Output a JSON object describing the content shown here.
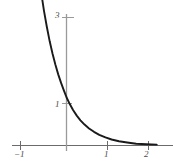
{
  "chart_data": {
    "type": "line",
    "title": "",
    "subtitle": "",
    "xlabel": "",
    "ylabel": "",
    "xlim": [
      -1,
      2.25
    ],
    "ylim": [
      -0.22,
      3.45
    ],
    "grid": false,
    "legend": null,
    "annotations": [],
    "x_ticks": [
      {
        "value": -1,
        "label": "−1"
      },
      {
        "value": 0,
        "label": ""
      },
      {
        "value": 1,
        "label": "1"
      },
      {
        "value": 2,
        "label": "2"
      }
    ],
    "y_ticks": [
      {
        "value": 1,
        "label": "1"
      },
      {
        "value": 3,
        "label": "3"
      }
    ],
    "series": [
      {
        "name": "exponential-decay",
        "color": "#1a1a1a",
        "x": [
          -0.62,
          -0.55,
          -0.48,
          -0.41,
          -0.34,
          -0.27,
          -0.2,
          -0.13,
          -0.06,
          0.0,
          0.08,
          0.16,
          0.25,
          0.34,
          0.44,
          0.55,
          0.67,
          0.8,
          0.95,
          1.1,
          1.28,
          1.48,
          1.7,
          1.95,
          2.2
        ],
        "y": [
          3.6,
          3.16,
          2.78,
          2.44,
          2.15,
          1.89,
          1.66,
          1.46,
          1.28,
          1.13,
          0.97,
          0.83,
          0.7,
          0.59,
          0.49,
          0.4,
          0.32,
          0.25,
          0.19,
          0.14,
          0.1,
          0.07,
          0.04,
          0.03,
          0.02
        ]
      }
    ]
  },
  "axes": {
    "x_axis_color": "#6b6b6b",
    "y_axis_color": "#9a9a9a",
    "curve_color": "#1a1a1a",
    "background": "#ffffff"
  },
  "labels": {
    "x_neg_one": "−1",
    "x_one": "1",
    "x_two": "2",
    "y_one": "1",
    "y_three": "3"
  }
}
